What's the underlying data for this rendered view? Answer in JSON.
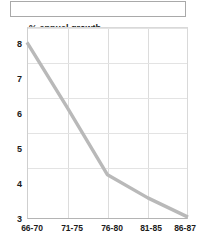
{
  "top_box": {
    "label": ""
  },
  "chart_data": {
    "type": "line",
    "title": "",
    "axis_title": "% annual growth",
    "xlabel": "",
    "ylabel": "% annual growth",
    "categories": [
      "66-70",
      "71-75",
      "76-80",
      "81-85",
      "86-87"
    ],
    "series": [
      {
        "name": "% annual growth",
        "values": [
          7.6,
          5.9,
          4.15,
          3.55,
          3.05
        ],
        "color": "#b9b9b9"
      }
    ],
    "y_ticks": [
      "8",
      "7",
      "6",
      "5",
      "4",
      "3"
    ],
    "ylim": [
      3,
      8
    ],
    "grid": "both",
    "legend": "none"
  },
  "colors": {
    "line": "#b9b9b9",
    "grid": "#dcdcdc",
    "axis": "#b4b4b4",
    "text": "#1b1b1b",
    "box_border": "#a9a9a9"
  }
}
